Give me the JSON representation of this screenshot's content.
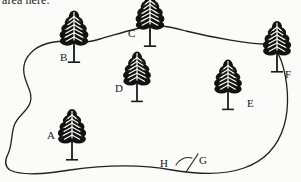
{
  "page": {
    "background_color": "#fbfbf9",
    "ink_color": "#1b1b1b",
    "clipped_caption": "area here."
  },
  "diagram": {
    "type": "hand-drawn land survey plot sketch",
    "boundary": {
      "name": "property-boundary",
      "closed": true,
      "stroke_color": "#222222",
      "stroke_width": 1.3
    },
    "trees": [
      {
        "id": "A",
        "label": "A",
        "x": 72,
        "y": 140,
        "scale": 1.0,
        "label_x": 47,
        "label_y": 130,
        "on_boundary": false
      },
      {
        "id": "B",
        "label": "B",
        "x": 74,
        "y": 42,
        "scale": 1.02,
        "label_x": 60,
        "label_y": 52,
        "on_boundary": true
      },
      {
        "id": "C",
        "label": "C",
        "x": 150,
        "y": 26,
        "scale": 1.02,
        "label_x": 128,
        "label_y": 28,
        "on_boundary": true
      },
      {
        "id": "D",
        "label": "D",
        "x": 137,
        "y": 82,
        "scale": 0.98,
        "label_x": 115,
        "label_y": 83,
        "on_boundary": false
      },
      {
        "id": "E",
        "label": "E",
        "x": 228,
        "y": 90,
        "scale": 0.98,
        "label_x": 247,
        "label_y": 98,
        "on_boundary": false
      },
      {
        "id": "F",
        "label": "F",
        "x": 277,
        "y": 52,
        "scale": 1.0,
        "label_x": 285,
        "label_y": 69,
        "on_boundary": true
      }
    ],
    "angle_marker": {
      "name": "bottom-angle-marker",
      "vertex_x": 186,
      "vertex_y": 172,
      "ray_end_x": 198,
      "ray_end_y": 154,
      "arc_radius": 14,
      "points": [
        {
          "id": "H",
          "label": "H",
          "label_x": 160,
          "label_y": 158
        },
        {
          "id": "G",
          "label": "G",
          "label_x": 199,
          "label_y": 155
        }
      ]
    }
  }
}
